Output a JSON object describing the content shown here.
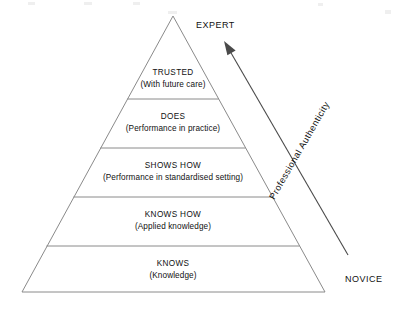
{
  "diagram": {
    "type": "pyramid",
    "background_color": "#ffffff",
    "line_color": "#8a8a8a",
    "arrow_color": "#4a4a4a",
    "text_color": "#111111",
    "geometry": {
      "apex": [
        173,
        16
      ],
      "base_left": [
        22,
        292
      ],
      "base_right": [
        325,
        292
      ],
      "divider_y": [
        99,
        148,
        197,
        246
      ]
    },
    "tiers": [
      {
        "level": 5,
        "title": "TRUSTED",
        "subtitle": "(With future care)",
        "title_x": 173,
        "title_y": 75,
        "sub_x": 173,
        "sub_y": 87
      },
      {
        "level": 4,
        "title": "DOES",
        "subtitle": "(Performance in practice)",
        "title_x": 173,
        "title_y": 119,
        "sub_x": 173,
        "sub_y": 131
      },
      {
        "level": 3,
        "title": "SHOWS HOW",
        "subtitle": "(Performance in standardised setting)",
        "title_x": 173,
        "title_y": 168,
        "sub_x": 173,
        "sub_y": 180
      },
      {
        "level": 2,
        "title": "KNOWS HOW",
        "subtitle": "(Applied knowledge)",
        "title_x": 173,
        "title_y": 217,
        "sub_x": 173,
        "sub_y": 229
      },
      {
        "level": 1,
        "title": "KNOWS",
        "subtitle": "(Knowledge)",
        "title_x": 173,
        "title_y": 266,
        "sub_x": 173,
        "sub_y": 278
      }
    ],
    "arrow": {
      "label": "Professional Authenticity",
      "direction": "upward",
      "tail": [
        348,
        255
      ],
      "tip": [
        224,
        41
      ],
      "label_x": 302,
      "label_y": 152,
      "label_rotation": -60
    },
    "endpoints": {
      "top_label": "EXPERT",
      "top_x": 196,
      "top_y": 28,
      "bottom_label": "NOVICE",
      "bottom_x": 345,
      "bottom_y": 282
    }
  }
}
